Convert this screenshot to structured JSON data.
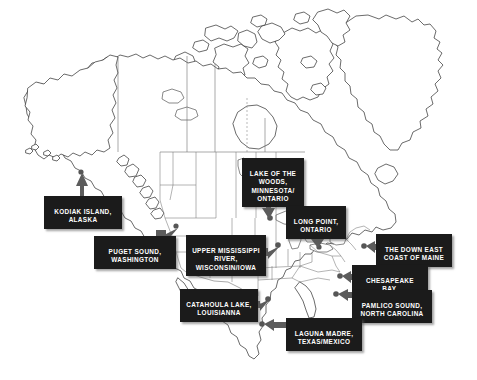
{
  "map": {
    "title": "North America coastal and inland water sites map",
    "background_color": "#ffffff",
    "land_outline_color": "#2b2b2b",
    "callout_background_color": "#1b1b1b",
    "callout_text_color": "#ffffff",
    "arrow_color": "#5c5c5c"
  },
  "callouts": [
    {
      "id": "kodiak-island-alaska",
      "lines": [
        "KODIAK ISLAND,",
        "ALASKA"
      ],
      "text": "KODIAK ISLAND,\nALASKA",
      "arrow_direction": "up",
      "region": "Alaska"
    },
    {
      "id": "puget-sound-washington",
      "lines": [
        "PUGET SOUND,",
        "WASHINGTON"
      ],
      "text": "PUGET SOUND,\nWASHINGTON",
      "arrow_direction": "right",
      "region": "Washington"
    },
    {
      "id": "upper-mississippi-river-wisconsin-iowa",
      "lines": [
        "UPPER MISSISSIPPI",
        "RIVER,",
        "WISCONSIN/IOWA"
      ],
      "text": "UPPER MISSISSIPPI\nRIVER,\nWISCONSIN/IOWA",
      "arrow_direction": "right",
      "region": "Wisconsin/Iowa"
    },
    {
      "id": "lake-of-the-woods-minnesota-ontario",
      "lines": [
        "LAKE OF THE",
        "WOODS,",
        "MINNESOTA/",
        "ONTARIO"
      ],
      "text": "LAKE OF THE\nWOODS,\nMINNESOTA/\nONTARIO",
      "arrow_direction": "down",
      "region": "Minnesota/Ontario"
    },
    {
      "id": "long-point-ontario",
      "lines": [
        "LONG POINT,",
        "ONTARIO"
      ],
      "text": "LONG POINT,\nONTARIO",
      "arrow_direction": "down",
      "region": "Ontario"
    },
    {
      "id": "the-down-east-coast-of-maine",
      "lines": [
        "THE DOWN EAST",
        "COAST OF MAINE"
      ],
      "text": "THE DOWN EAST\nCOAST OF MAINE",
      "arrow_direction": "left",
      "region": "Maine"
    },
    {
      "id": "chesapeake-bay-maryland",
      "lines": [
        "CHESAPEAKE BAY,",
        "MARYLAND"
      ],
      "text": "CHESAPEAKE BAY,\nMARYLAND",
      "arrow_direction": "left",
      "region": "Maryland"
    },
    {
      "id": "pamlico-sound-north-carolina",
      "lines": [
        "PAMLICO SOUND,",
        "NORTH CAROLINA"
      ],
      "text": "PAMLICO SOUND,\nNORTH CAROLINA",
      "arrow_direction": "left",
      "region": "North Carolina"
    },
    {
      "id": "catahoula-lake-louisianna",
      "lines": [
        "CATAHOULA LAKE,",
        "LOUISIANNA"
      ],
      "text": "CATAHOULA LAKE,\nLOUISIANNA",
      "arrow_direction": "right",
      "region": "Louisiana"
    },
    {
      "id": "laguna-madre-texas-mexico",
      "lines": [
        "LAGUNA MADRE,",
        "TEXAS/MEXICO"
      ],
      "text": "LAGUNA MADRE,\nTEXAS/MEXICO",
      "arrow_direction": "left",
      "region": "Texas/Mexico"
    }
  ]
}
